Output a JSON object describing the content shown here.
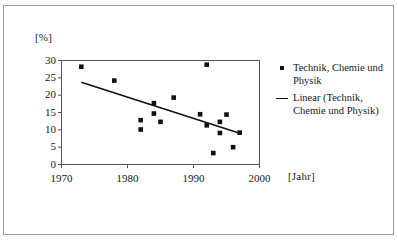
{
  "figure": {
    "y_axis_unit": "[%]",
    "x_axis_unit": "[Jahr]"
  },
  "legend": {
    "position": "right",
    "entries": [
      {
        "key": "marker-square",
        "label": "Technik, Chemie und Physik"
      },
      {
        "key": "trend-line",
        "label": "Linear (Technik,\nChemie und Physik)"
      }
    ]
  },
  "chart_data": {
    "type": "scatter",
    "title": "",
    "xlabel": "[Jahr]",
    "ylabel": "[%]",
    "xlim": [
      1970,
      2000
    ],
    "ylim": [
      0,
      30
    ],
    "xticks": [
      1970,
      1980,
      1990,
      2000
    ],
    "yticks": [
      0,
      5,
      10,
      15,
      20,
      25,
      30
    ],
    "grid": false,
    "series": [
      {
        "name": "Technik, Chemie und Physik",
        "type": "scatter",
        "marker": "square",
        "color": "#111111",
        "points": [
          {
            "x": 1973,
            "y": 28.2
          },
          {
            "x": 1978,
            "y": 24.2
          },
          {
            "x": 1982,
            "y": 12.8
          },
          {
            "x": 1982,
            "y": 10.1
          },
          {
            "x": 1984,
            "y": 17.7
          },
          {
            "x": 1984,
            "y": 14.7
          },
          {
            "x": 1985,
            "y": 12.3
          },
          {
            "x": 1987,
            "y": 19.3
          },
          {
            "x": 1991,
            "y": 14.5
          },
          {
            "x": 1992,
            "y": 28.8
          },
          {
            "x": 1992,
            "y": 11.3
          },
          {
            "x": 1993,
            "y": 3.3
          },
          {
            "x": 1994,
            "y": 12.3
          },
          {
            "x": 1994,
            "y": 9.1
          },
          {
            "x": 1995,
            "y": 14.4
          },
          {
            "x": 1996,
            "y": 5.0
          },
          {
            "x": 1997,
            "y": 9.2
          }
        ]
      },
      {
        "name": "Linear (Technik, Chemie und Physik)",
        "type": "line",
        "color": "#111111",
        "points": [
          {
            "x": 1973,
            "y": 23.7
          },
          {
            "x": 1997,
            "y": 9.0
          }
        ]
      }
    ]
  }
}
